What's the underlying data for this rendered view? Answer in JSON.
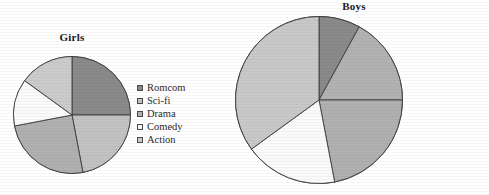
{
  "chart_data": [
    {
      "type": "pie",
      "title": "Girls",
      "categories": [
        "Romcom",
        "Sci-fi",
        "Drama",
        "Comedy",
        "Action"
      ],
      "values": [
        25,
        22,
        25,
        13,
        15
      ],
      "units": "percent",
      "start_angle_deg": 0,
      "direction": "clockwise",
      "legend_position": "right",
      "grid": false,
      "xlabel": "",
      "ylabel": "",
      "colors": [
        "#8a8a8a",
        "#c2c2c2",
        "#b0b0b0",
        "#fafafa",
        "#cbcbcb"
      ]
    },
    {
      "type": "pie",
      "title": "Boys",
      "categories": [
        "Romcom",
        "Sci-fi",
        "Drama",
        "Comedy",
        "Action"
      ],
      "values": [
        8,
        17,
        22,
        18,
        35
      ],
      "units": "percent",
      "start_angle_deg": 0,
      "direction": "clockwise",
      "legend_position": "right",
      "grid": false,
      "xlabel": "",
      "ylabel": "",
      "colors": [
        "#8a8a8a",
        "#b2b2b2",
        "#b0b0b0",
        "#fafafa",
        "#c8c8c8"
      ]
    }
  ],
  "girls": {
    "title": "Girls",
    "legend": [
      {
        "label": "Romcom",
        "color": "#8a8a8a"
      },
      {
        "label": "Sci-fi",
        "color": "#c2c2c2"
      },
      {
        "label": "Drama",
        "color": "#b0b0b0"
      },
      {
        "label": "Comedy",
        "color": "#fafafa"
      },
      {
        "label": "Action",
        "color": "#cbcbcb"
      }
    ]
  },
  "boys": {
    "title": "Boys",
    "legend": [
      {
        "label": "Romcom",
        "color": "#8a8a8a"
      },
      {
        "label": "Sci-fi",
        "color": "#b2b2b2"
      },
      {
        "label": "Drama",
        "color": "#b0b0b0"
      },
      {
        "label": "Comedy",
        "color": "#fafafa"
      },
      {
        "label": "Action",
        "color": "#c8c8c8"
      }
    ]
  },
  "style": {
    "stroke": "#3c3c3c",
    "text_color": "#2b2b2b"
  }
}
